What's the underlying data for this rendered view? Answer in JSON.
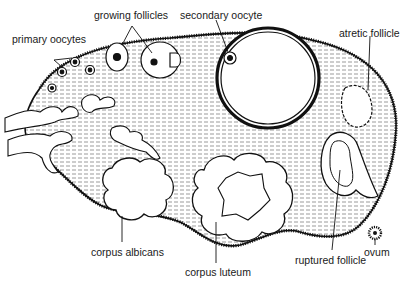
{
  "diagram": {
    "labels": {
      "growing_follicles": "growing follicles",
      "secondary_oocyte": "secondary oocyte",
      "primary_oocytes": "primary oocytes",
      "atretic_follicle": "atretic follicle",
      "corpus_albicans": "corpus albicans",
      "corpus_luteum": "corpus luteum",
      "ruptured_follicle": "ruptured follicle",
      "ovum": "ovum"
    }
  }
}
